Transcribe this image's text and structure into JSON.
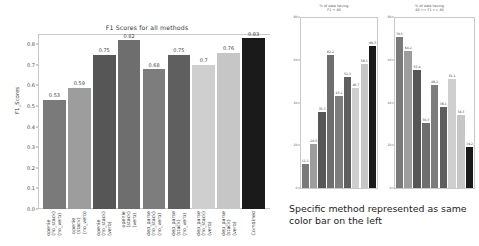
{
  "chart_data": [
    {
      "type": "bar",
      "title": "F1 Scores for all methods",
      "xlabel": "",
      "ylabel": "F1_Scores",
      "ylim": [
        0.0,
        0.85
      ],
      "yticks": [
        "0.0",
        "0.1",
        "0.2",
        "0.3",
        "0.4",
        "0.5",
        "0.6",
        "0.7",
        "0.8"
      ],
      "ytick_values": [
        0.0,
        0.1,
        0.2,
        0.3,
        0.4,
        0.5,
        0.6,
        0.7,
        0.8
      ],
      "grid": false,
      "legend": "none",
      "categories": [
        "openie\n(no_stack)\n(no_verb)",
        "openie\n(stack)\n(no_verb)",
        "openie\n(no_stack)\n(verb)",
        "openie\n(stack)\n(verb)",
        "dep_parse\n(no_stack)\n(no_verb)",
        "dep_parse\n(stack)\n(no_verb)",
        "dep_parse\n(no_stack)\n(verb)",
        "dep_parse\n(stack)\n(verb)",
        "Combined"
      ],
      "values": [
        0.53,
        0.59,
        0.75,
        0.82,
        0.68,
        0.75,
        0.7,
        0.76,
        0.83
      ],
      "value_labels": [
        "0.53",
        "0.59",
        "0.75",
        "0.82",
        "0.68",
        "0.75",
        "0.7",
        "0.76",
        "0.83"
      ],
      "bar_colors": [
        "#7a7a7a",
        "#9d9d9d",
        "#565656",
        "#6e6e6e",
        "#7d7d7d",
        "#5f5f5f",
        "#cfcfcf",
        "#c6c6c6",
        "#1a1a1a"
      ]
    },
    {
      "type": "bar",
      "title": "% of data having\nF1 < 40",
      "xlabel": "",
      "ylabel": "",
      "ylim": [
        0,
        80
      ],
      "yticks": [
        "0",
        "20",
        "40",
        "60",
        "80"
      ],
      "ytick_values": [
        0,
        20,
        40,
        60,
        80
      ],
      "grid": false,
      "legend": "none",
      "categories": [
        "openie (no_stack)(no_verb)",
        "openie (stack)(no_verb)",
        "openie (no_stack)(verb)",
        "openie (stack)(verb)",
        "dep_parse (no_stack)(no_verb)",
        "dep_parse (stack)(no_verb)",
        "dep_parse (no_stack)(verb)",
        "dep_parse (stack)(verb)",
        "Combined"
      ],
      "values": [
        11.1,
        20.5,
        35.7,
        62.2,
        43.2,
        52.1,
        46.7,
        58.1,
        66.3
      ],
      "value_labels": [
        "11.1",
        "20.5",
        "35.7",
        "62.2",
        "43.2",
        "52.1",
        "46.7",
        "58.1",
        "66.3"
      ],
      "bar_colors": [
        "#7a7a7a",
        "#9d9d9d",
        "#565656",
        "#6e6e6e",
        "#7d7d7d",
        "#5f5f5f",
        "#cfcfcf",
        "#c6c6c6",
        "#1a1a1a"
      ]
    },
    {
      "type": "bar",
      "title": "% of data having\n40 <= F1 <= 80",
      "xlabel": "",
      "ylabel": "",
      "ylim": [
        0,
        80
      ],
      "yticks": [
        "0",
        "20",
        "40",
        "60",
        "80"
      ],
      "ytick_values": [
        0,
        20,
        40,
        60,
        80
      ],
      "grid": false,
      "legend": "none",
      "categories": [
        "openie (no_stack)(no_verb)",
        "openie (stack)(no_verb)",
        "openie (no_stack)(verb)",
        "openie (stack)(verb)",
        "dep_parse (no_stack)(no_verb)",
        "dep_parse (stack)(no_verb)",
        "dep_parse (no_stack)(verb)",
        "dep_parse (stack)(verb)",
        "Combined"
      ],
      "values": [
        70.5,
        64.2,
        55.4,
        30.3,
        48.2,
        38.1,
        51.1,
        34.3,
        19.2
      ],
      "value_labels": [
        "70.5",
        "64.2",
        "55.4",
        "30.3",
        "48.2",
        "38.1",
        "51.1",
        "34.3",
        "19.2"
      ],
      "bar_colors": [
        "#7a7a7a",
        "#9d9d9d",
        "#565656",
        "#6e6e6e",
        "#7d7d7d",
        "#5f5f5f",
        "#cfcfcf",
        "#c6c6c6",
        "#1a1a1a"
      ]
    }
  ],
  "caption": {
    "text": "Specific method represented as same color bar on the left"
  }
}
